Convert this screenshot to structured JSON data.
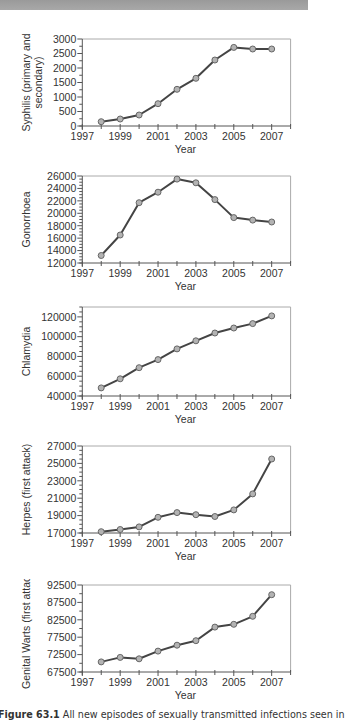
{
  "header": {
    "band": "top-gray-band"
  },
  "caption": {
    "label": "Figure 63.1",
    "text": "All new episodes of sexually transmitted infections seen in"
  },
  "style": {
    "line_color": "#444444",
    "marker_fill": "#b3b3b3",
    "marker_stroke": "#666666",
    "axis_color": "#555555",
    "frame_color": "#aaaaaa"
  },
  "chart_data": [
    {
      "type": "line",
      "title": "",
      "xlabel": "Year",
      "ylabel": "Syphilis (primary and secondary)",
      "ylabel_lines": [
        "Syphilis (primary and",
        "secondary)"
      ],
      "x": [
        1998,
        1999,
        2000,
        2001,
        2002,
        2003,
        2004,
        2005,
        2006,
        2007
      ],
      "values": [
        150,
        240,
        380,
        770,
        1265,
        1645,
        2275,
        2710,
        2655,
        2655
      ],
      "xlim": [
        1997,
        2008
      ],
      "xticks": [
        1997,
        1999,
        2001,
        2003,
        2005,
        2007
      ],
      "xtick_labels": [
        "1997",
        "1999",
        "2001",
        "2003",
        "2005",
        "2007"
      ],
      "ylim": [
        0,
        3000
      ],
      "yticks": [
        0,
        500,
        1000,
        1500,
        2000,
        2500,
        3000
      ],
      "ytick_labels": [
        "0",
        "500",
        "1000",
        "1500",
        "2000",
        "2500",
        "3000"
      ],
      "minor_per_major": 1,
      "grid": false,
      "legend": "none"
    },
    {
      "type": "line",
      "title": "",
      "xlabel": "Year",
      "ylabel": "Gonorrhoea",
      "ylabel_lines": [
        "Gonorrhoea"
      ],
      "x": [
        1998,
        1999,
        2000,
        2001,
        2002,
        2003,
        2004,
        2005,
        2006,
        2007
      ],
      "values": [
        13200,
        16500,
        21700,
        23400,
        25500,
        24900,
        22200,
        19300,
        18900,
        18600
      ],
      "xlim": [
        1997,
        2008
      ],
      "xticks": [
        1997,
        1999,
        2001,
        2003,
        2005,
        2007
      ],
      "xtick_labels": [
        "1997",
        "1999",
        "2001",
        "2003",
        "2005",
        "2007"
      ],
      "ylim": [
        12000,
        26000
      ],
      "yticks": [
        12000,
        14000,
        16000,
        18000,
        20000,
        22000,
        24000,
        26000
      ],
      "ytick_labels": [
        "12000",
        "14000",
        "16000",
        "18000",
        "20000",
        "22000",
        "24000",
        "26000"
      ],
      "minor_per_major": 3,
      "grid": false,
      "legend": "none"
    },
    {
      "type": "line",
      "title": "",
      "xlabel": "Year",
      "ylabel": "Chlamydia",
      "ylabel_lines": [
        "Chlamydia"
      ],
      "x": [
        1998,
        1999,
        2000,
        2001,
        2002,
        2003,
        2004,
        2005,
        2006,
        2007
      ],
      "values": [
        48200,
        57400,
        68600,
        76800,
        87600,
        95800,
        103700,
        108800,
        113200,
        121000
      ],
      "xlim": [
        1997,
        2008
      ],
      "xticks": [
        1997,
        1999,
        2001,
        2003,
        2005,
        2007
      ],
      "xtick_labels": [
        "1997",
        "1999",
        "2001",
        "2003",
        "2005",
        "2007"
      ],
      "ylim": [
        40000,
        130000
      ],
      "yticks": [
        40000,
        60000,
        80000,
        100000,
        120000
      ],
      "ytick_labels": [
        "40000",
        "60000",
        "80000",
        "100000",
        "120000"
      ],
      "minor_per_major": 3,
      "grid": false,
      "legend": "none"
    },
    {
      "type": "line",
      "title": "",
      "xlabel": "Year",
      "ylabel": "Herpes (first attack)",
      "ylabel_lines": [
        "Herpes (first attack)"
      ],
      "x": [
        1998,
        1999,
        2000,
        2001,
        2002,
        2003,
        2004,
        2005,
        2006,
        2007
      ],
      "values": [
        17150,
        17400,
        17700,
        18800,
        19350,
        19100,
        18900,
        19650,
        21500,
        25500
      ],
      "xlim": [
        1997,
        2008
      ],
      "xticks": [
        1997,
        1999,
        2001,
        2003,
        2005,
        2007
      ],
      "xtick_labels": [
        "1997",
        "1999",
        "2001",
        "2003",
        "2005",
        "2007"
      ],
      "ylim": [
        17000,
        27000
      ],
      "yticks": [
        17000,
        19000,
        21000,
        23000,
        25000,
        27000
      ],
      "ytick_labels": [
        "17000",
        "19000",
        "21000",
        "23000",
        "25000",
        "27000"
      ],
      "minor_per_major": 3,
      "grid": false,
      "legend": "none"
    },
    {
      "type": "line",
      "title": "",
      "xlabel": "Year",
      "ylabel": "Genital Warts (first attack)",
      "ylabel_lines": [
        "Genital Warts (first attack)"
      ],
      "x": [
        1998,
        1999,
        2000,
        2001,
        2002,
        2003,
        2004,
        2005,
        2006,
        2007
      ],
      "values": [
        70400,
        71700,
        71300,
        73500,
        75200,
        76500,
        80400,
        81200,
        83500,
        89700
      ],
      "xlim": [
        1997,
        2008
      ],
      "xticks": [
        1997,
        1999,
        2001,
        2003,
        2005,
        2007
      ],
      "xtick_labels": [
        "1997",
        "1999",
        "2001",
        "2003",
        "2005",
        "2007"
      ],
      "ylim": [
        67500,
        92500
      ],
      "yticks": [
        67500,
        72500,
        77500,
        82500,
        87500,
        92500
      ],
      "ytick_labels": [
        "67500",
        "72500",
        "77500",
        "82500",
        "87500",
        "92500"
      ],
      "minor_per_major": 1,
      "grid": false,
      "legend": "none"
    }
  ]
}
